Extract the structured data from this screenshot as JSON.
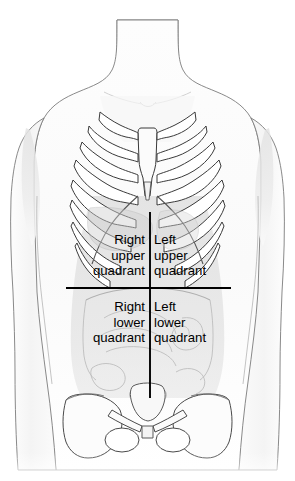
{
  "diagram": {
    "background_color": "#ffffff",
    "outline_color": "#6b6b6b",
    "bone_outline_color": "#3a3a3a",
    "organ_outline_color": "#b8b8b8",
    "divider_color": "#000000",
    "skin_fill": "#fbfbfb",
    "abdomen_shade": "#dcdcdc",
    "bone_fill": "#ffffff",
    "text_color": "#000000"
  },
  "quadrants": {
    "right_upper": {
      "name": "right-upper-quadrant",
      "line1": "Right",
      "line2": "upper",
      "line3": "quadrant",
      "align": "right"
    },
    "left_upper": {
      "name": "left-upper-quadrant",
      "line1": "Left",
      "line2": "upper",
      "line3": "quadrant",
      "align": "left"
    },
    "right_lower": {
      "name": "right-lower-quadrant",
      "line1": "Right",
      "line2": "lower",
      "line3": "quadrant",
      "align": "right"
    },
    "left_lower": {
      "name": "left-lower-quadrant",
      "line1": "Left",
      "line2": "lower",
      "line3": "quadrant",
      "align": "left"
    }
  },
  "dividers": {
    "vertical": {
      "name": "median-vertical-divider",
      "x": 150,
      "y_top": 212,
      "y_bottom": 398
    },
    "horizontal": {
      "name": "transumbilical-horizontal-divider",
      "y": 288,
      "x_left": 66,
      "x_right": 231
    }
  },
  "anatomy_parts": [
    "neck",
    "shoulders",
    "left-arm",
    "right-arm",
    "clavicle",
    "sternum",
    "rib-cage",
    "costal-cartilage",
    "liver",
    "stomach",
    "small-intestine",
    "large-intestine",
    "pelvis",
    "sacrum",
    "iliac-crest",
    "obturator-foramen",
    "pubic-symphysis"
  ]
}
